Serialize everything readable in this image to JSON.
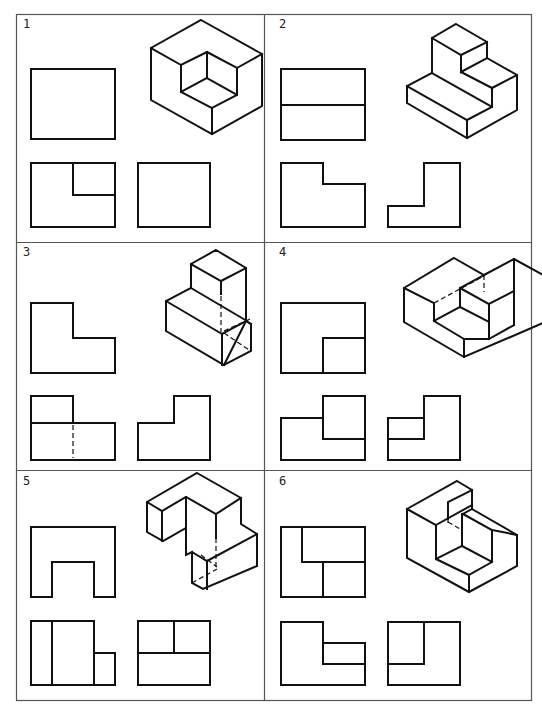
{
  "caption": "",
  "figure": {
    "panels": [
      {
        "number": "1",
        "views": [
          "front-view",
          "top-view",
          "side-view",
          "isometric"
        ]
      },
      {
        "number": "2",
        "views": [
          "front-view",
          "top-view",
          "side-view",
          "isometric"
        ]
      },
      {
        "number": "3",
        "views": [
          "front-view",
          "top-view",
          "side-view",
          "isometric"
        ]
      },
      {
        "number": "4",
        "views": [
          "front-view",
          "top-view",
          "side-view",
          "isometric"
        ]
      },
      {
        "number": "5",
        "views": [
          "front-view",
          "top-view",
          "side-view",
          "isometric"
        ]
      },
      {
        "number": "6",
        "views": [
          "front-view",
          "top-view",
          "side-view",
          "isometric"
        ]
      }
    ]
  },
  "colors": {
    "line": "#111111",
    "frame": "#555555",
    "background": "#ffffff"
  }
}
